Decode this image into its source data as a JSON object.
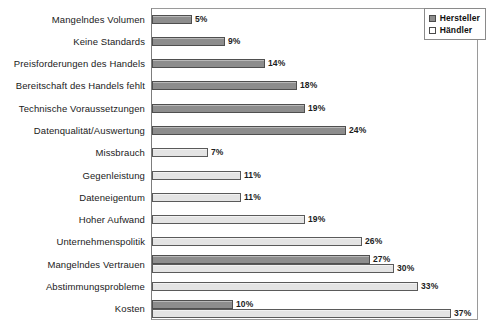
{
  "chart_data": {
    "type": "bar",
    "orientation": "horizontal",
    "title": "",
    "xlabel": "",
    "ylabel": "",
    "xlim": [
      0,
      41
    ],
    "grid": false,
    "legend_position": "top-right",
    "value_suffix": "%",
    "categories": [
      "Mangelndes Volumen",
      "Keine Standards",
      "Preisforderungen des Handels",
      "Bereitschaft des Handels fehlt",
      "Technische Voraussetzungen",
      "Datenqualität/Auswertung",
      "Missbrauch",
      "Gegenleistung",
      "Dateneigentum",
      "Hoher Aufwand",
      "Unternehmenspolitik",
      "Mangelndes Vertrauen",
      "Abstimmungsprobleme",
      "Kosten"
    ],
    "series": [
      {
        "name": "Hersteller",
        "color": "#8d8d8d",
        "values": [
          5,
          9,
          14,
          18,
          19,
          24,
          null,
          null,
          null,
          null,
          null,
          27,
          null,
          10
        ],
        "labels": [
          "5%",
          "9%",
          "14%",
          "18%",
          "19%",
          "24%",
          null,
          null,
          null,
          null,
          null,
          "27%",
          null,
          "10%"
        ]
      },
      {
        "name": "Händler",
        "color": "#e4e4e4",
        "values": [
          null,
          null,
          null,
          null,
          null,
          null,
          7,
          11,
          11,
          19,
          26,
          30,
          33,
          37
        ],
        "labels": [
          null,
          null,
          null,
          null,
          null,
          null,
          "7%",
          "11%",
          "11%",
          "19%",
          "26%",
          "30%",
          "33%",
          "37%"
        ]
      }
    ]
  },
  "legend": {
    "items": [
      {
        "label": "Hersteller",
        "swatch": "swatch-filled-icon"
      },
      {
        "label": "Händler",
        "swatch": "swatch-empty-icon"
      }
    ]
  }
}
